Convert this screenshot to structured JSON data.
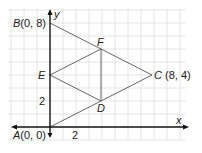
{
  "diagram": {
    "type": "coordinate-geometry",
    "axes": {
      "x_label": "x",
      "y_label": "y",
      "tick_labels": {
        "x": "2",
        "y": "2"
      }
    },
    "points": {
      "A": {
        "label": "A",
        "coords_text": "(0, 0)",
        "x": 0,
        "y": 0
      },
      "B": {
        "label": "B",
        "coords_text": "(0, 8)",
        "x": 0,
        "y": 8
      },
      "C": {
        "label": "C",
        "coords_text": " (8, 4)",
        "x": 8,
        "y": 4
      },
      "D": {
        "label": "D",
        "x": 4,
        "y": 2
      },
      "E": {
        "label": "E",
        "x": 0,
        "y": 4
      },
      "F": {
        "label": "F",
        "x": 4,
        "y": 6
      }
    },
    "segments": [
      "A-C",
      "B-C",
      "E-F",
      "E-D",
      "F-D"
    ],
    "colors": {
      "grid": "#e6e6e6",
      "axis": "#111111",
      "line": "#555555"
    }
  }
}
